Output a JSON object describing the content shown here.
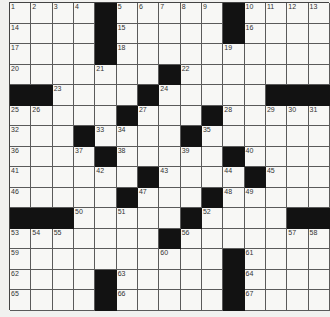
{
  "puzzle": {
    "size": 15,
    "rows": [
      "....#.....#....",
      "....#.....#....",
      "....#..........",
      ".......#.......",
      "##....#.....###",
      ".....#...#.....",
      "...#....#......",
      "....#.....#....",
      "......#....#...",
      ".....#...#.....",
      "###.....#....##",
      ".......#.......",
      "..........#....",
      "....#.....#....",
      "....#.....#...."
    ],
    "numbers": [
      [
        1,
        2,
        3,
        4,
        0,
        5,
        6,
        7,
        8,
        9,
        0,
        10,
        11,
        12,
        13
      ],
      [
        14,
        0,
        0,
        0,
        0,
        15,
        0,
        0,
        0,
        0,
        0,
        16,
        0,
        0,
        0
      ],
      [
        17,
        0,
        0,
        0,
        0,
        18,
        0,
        0,
        0,
        0,
        19,
        0,
        0,
        0,
        0
      ],
      [
        20,
        0,
        0,
        0,
        21,
        0,
        0,
        0,
        22,
        0,
        0,
        0,
        0,
        0,
        0
      ],
      [
        0,
        0,
        23,
        0,
        0,
        0,
        0,
        24,
        0,
        0,
        0,
        0,
        0,
        0,
        0
      ],
      [
        25,
        26,
        0,
        0,
        0,
        0,
        27,
        0,
        0,
        0,
        28,
        0,
        29,
        30,
        31
      ],
      [
        32,
        0,
        0,
        0,
        33,
        34,
        0,
        0,
        0,
        35,
        0,
        0,
        0,
        0,
        0
      ],
      [
        36,
        0,
        0,
        37,
        0,
        38,
        0,
        0,
        39,
        0,
        0,
        40,
        0,
        0,
        0
      ],
      [
        41,
        0,
        0,
        0,
        42,
        0,
        0,
        43,
        0,
        0,
        44,
        0,
        45,
        0,
        0
      ],
      [
        46,
        0,
        0,
        0,
        0,
        0,
        47,
        0,
        0,
        0,
        48,
        49,
        0,
        0,
        0
      ],
      [
        0,
        0,
        0,
        50,
        0,
        51,
        0,
        0,
        0,
        52,
        0,
        0,
        0,
        0,
        0
      ],
      [
        53,
        54,
        55,
        0,
        0,
        0,
        0,
        0,
        56,
        0,
        0,
        0,
        0,
        57,
        58
      ],
      [
        59,
        0,
        0,
        0,
        0,
        0,
        0,
        60,
        0,
        0,
        0,
        61,
        0,
        0,
        0
      ],
      [
        62,
        0,
        0,
        0,
        0,
        63,
        0,
        0,
        0,
        0,
        0,
        64,
        0,
        0,
        0
      ],
      [
        65,
        0,
        0,
        0,
        0,
        66,
        0,
        0,
        0,
        0,
        0,
        67,
        0,
        0,
        0
      ]
    ],
    "letters": [],
    "colors": {
      "black": "#121212",
      "white": "#f7f7f5",
      "line": "#5a5a5a",
      "number": "#333333"
    }
  }
}
